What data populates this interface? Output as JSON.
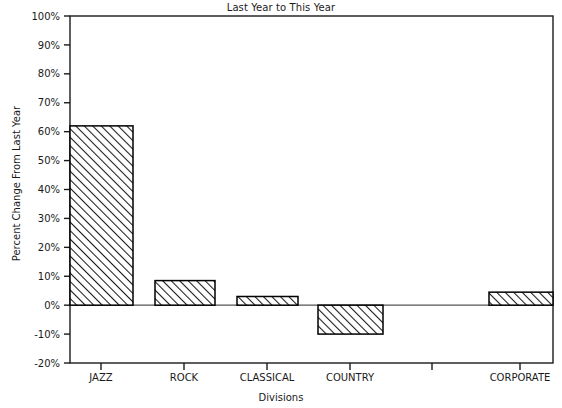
{
  "chart_data": {
    "type": "bar",
    "title": "Last Year to This Year",
    "xlabel": "Divisions",
    "ylabel": "Percent Change From Last Year",
    "categories": [
      "JAZZ",
      "ROCK",
      "CLASSICAL",
      "COUNTRY",
      "",
      "CORPORATE"
    ],
    "values": [
      62,
      8.5,
      3,
      -10,
      null,
      4.5
    ],
    "ylim": [
      -20,
      100
    ],
    "ytick_values": [
      100,
      90,
      80,
      70,
      60,
      50,
      40,
      30,
      20,
      10,
      0,
      -10,
      -20
    ],
    "ytick_labels": [
      "100%",
      "90%",
      "80%",
      "70%",
      "60%",
      "50%",
      "40%",
      "30%",
      "20%",
      "10%",
      "0%",
      "-10%",
      "-20%"
    ],
    "grid": false,
    "legend": null,
    "bar_fill": "diagonal-hatch",
    "bar_edge_color": "#000000",
    "zero_line": 0
  },
  "colors": {
    "axis": "#1a1a1a",
    "bar_edge": "#000000",
    "hatch": "#1a1a1a",
    "background": "#ffffff"
  },
  "icons": {
    "chart_type": "bar-chart-icon"
  }
}
